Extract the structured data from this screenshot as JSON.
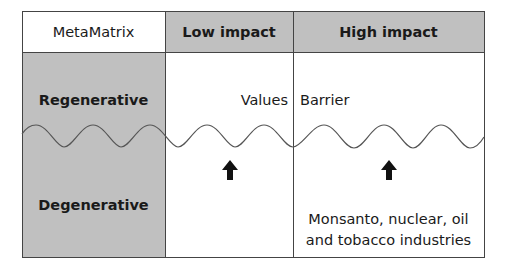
{
  "matrix": {
    "corner_label": "MetaMatrix",
    "columns": [
      "Low impact",
      "High impact"
    ],
    "rows": [
      "Regenerative",
      "Degenerative"
    ],
    "cells": {
      "low_regenerative": "Values",
      "high_regenerative": "Barrier",
      "high_degenerative_line1": "Monsanto, nuclear, oil",
      "high_degenerative_line2": "and tobacco industries"
    },
    "icons": [
      "arrow-up-icon",
      "arrow-up-icon"
    ],
    "colors": {
      "shaded": "#c0c0c0",
      "border": "#444444",
      "text": "#1a1a1a"
    }
  }
}
